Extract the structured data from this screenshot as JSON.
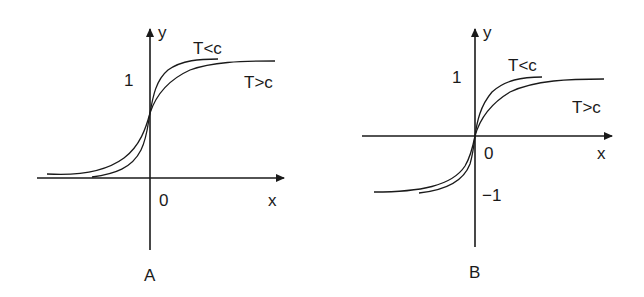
{
  "figure": {
    "panels": [
      {
        "id": "A",
        "caption": "A",
        "axis_x_label": "x",
        "axis_y_label": "y",
        "origin_label": "0",
        "y_tick_upper": "1",
        "curves": [
          {
            "label": "T<c",
            "description": "steeper sigmoid, saturates at 1"
          },
          {
            "label": "T>c",
            "description": "gentler sigmoid, saturates at 1"
          }
        ],
        "range": "0 to 1 (logistic-like)"
      },
      {
        "id": "B",
        "caption": "B",
        "axis_x_label": "x",
        "axis_y_label": "y",
        "origin_label": "0",
        "y_tick_upper": "1",
        "y_tick_lower": "−1",
        "curves": [
          {
            "label": "T<c",
            "description": "steeper tanh-like curve, -1 to 1"
          },
          {
            "label": "T>c",
            "description": "gentler tanh-like curve, -1 to 1"
          }
        ],
        "range": "-1 to 1 (tanh-like)"
      }
    ],
    "colors": {
      "ink": "#1a1a1a",
      "background": "#ffffff"
    }
  }
}
